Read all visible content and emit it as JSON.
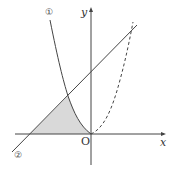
{
  "diagram": {
    "type": "function-graph",
    "axes": {
      "x_label": "x",
      "y_label": "y",
      "origin_label": "O"
    },
    "curves": [
      {
        "id": "curve-1",
        "marker": "①",
        "kind": "parabola-left-branch",
        "style": "solid"
      },
      {
        "id": "line-2",
        "marker": "②",
        "kind": "line",
        "style": "solid"
      },
      {
        "id": "curve-3",
        "marker": "",
        "kind": "parabola-right-branch",
        "style": "dashed"
      }
    ],
    "shaded_region": {
      "description": "region bounded by curve ①, line ② and the x-axis, left of the origin",
      "color": "#d9d9d9"
    },
    "colors": {
      "stroke": "#444444",
      "shade": "#d9d9d9",
      "background": "#ffffff"
    }
  }
}
